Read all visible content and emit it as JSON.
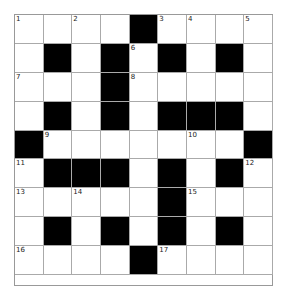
{
  "puzzle": {
    "rows": 9,
    "cols": 9,
    "colors": {
      "block": "#000000",
      "cell": "#ffffff",
      "line": "#aaaaaa"
    },
    "grid": [
      [
        "1",
        "",
        "2",
        "",
        "#",
        "3",
        "4",
        "",
        "5"
      ],
      [
        "",
        "#",
        "",
        "#",
        "6",
        "#",
        "",
        "#",
        ""
      ],
      [
        "7",
        "",
        "",
        "#",
        "8",
        "",
        "",
        "",
        ""
      ],
      [
        "",
        "#",
        "",
        "#",
        "",
        "#",
        "#",
        "#",
        ""
      ],
      [
        "#",
        "9",
        "",
        "",
        "",
        "",
        "10",
        "",
        "#"
      ],
      [
        "11",
        "#",
        "#",
        "#",
        "",
        "#",
        "",
        "#",
        "12"
      ],
      [
        "13",
        "",
        "14",
        "",
        "",
        "#",
        "15",
        "",
        ""
      ],
      [
        "",
        "#",
        "",
        "#",
        "",
        "#",
        "",
        "#",
        ""
      ],
      [
        "16",
        "",
        "",
        "",
        "#",
        "17",
        "",
        "",
        ""
      ]
    ]
  }
}
